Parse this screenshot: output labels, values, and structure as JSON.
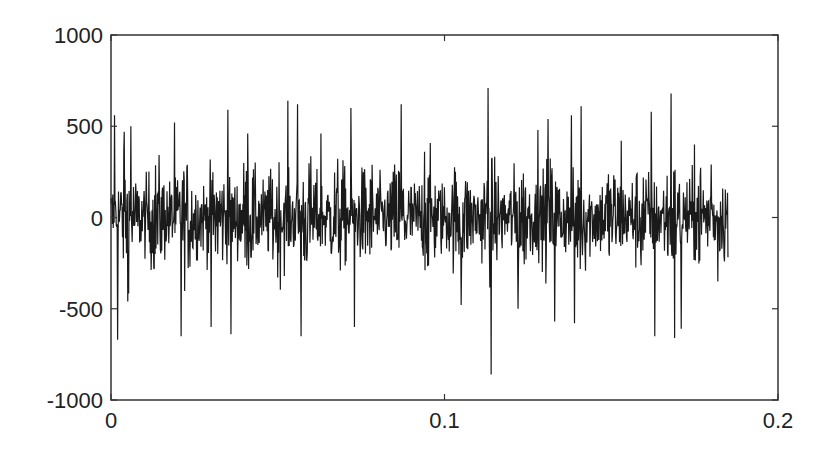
{
  "chart_data": {
    "type": "line",
    "title": "",
    "xlabel": "",
    "ylabel": "",
    "xlim": [
      0,
      0.2
    ],
    "ylim": [
      -1000,
      1000
    ],
    "xticks": [
      0,
      0.1,
      0.2
    ],
    "xtick_labels": [
      "0",
      "0.1",
      "0.2"
    ],
    "yticks": [
      -1000,
      -500,
      0,
      500,
      1000
    ],
    "ytick_labels": [
      "-1000",
      "-500",
      "0",
      "500",
      "1000"
    ],
    "grid": false,
    "legend": null,
    "series": [
      {
        "name": "signal",
        "color": "#1a1a1a",
        "description": "Dense noisy time-domain signal from t=0 to ~0.185 s, roughly zero-mean, typical amplitude ±250, peaks up to about +700 and down to about -860",
        "t_start": 0,
        "t_end": 0.185,
        "num_samples": 1400,
        "typical_amplitude": 160,
        "peak_positive": 710,
        "peak_negative": -860,
        "notable_peaks": [
          {
            "t": 0.001,
            "value": 560
          },
          {
            "t": 0.002,
            "value": -670
          },
          {
            "t": 0.004,
            "value": 470
          },
          {
            "t": 0.005,
            "value": -460
          },
          {
            "t": 0.006,
            "value": 500
          },
          {
            "t": 0.019,
            "value": 520
          },
          {
            "t": 0.021,
            "value": 590
          },
          {
            "t": 0.021,
            "value": -650
          },
          {
            "t": 0.03,
            "value": -600
          },
          {
            "t": 0.035,
            "value": 590
          },
          {
            "t": 0.036,
            "value": -640
          },
          {
            "t": 0.041,
            "value": 460
          },
          {
            "t": 0.053,
            "value": 640
          },
          {
            "t": 0.056,
            "value": 620
          },
          {
            "t": 0.057,
            "value": -650
          },
          {
            "t": 0.063,
            "value": 460
          },
          {
            "t": 0.072,
            "value": 600
          },
          {
            "t": 0.073,
            "value": -600
          },
          {
            "t": 0.087,
            "value": 620
          },
          {
            "t": 0.094,
            "value": 360
          },
          {
            "t": 0.105,
            "value": -480
          },
          {
            "t": 0.113,
            "value": 710
          },
          {
            "t": 0.114,
            "value": -860
          },
          {
            "t": 0.122,
            "value": -500
          },
          {
            "t": 0.128,
            "value": 480
          },
          {
            "t": 0.131,
            "value": 540
          },
          {
            "t": 0.133,
            "value": -570
          },
          {
            "t": 0.138,
            "value": 560
          },
          {
            "t": 0.139,
            "value": -580
          },
          {
            "t": 0.141,
            "value": 610
          },
          {
            "t": 0.153,
            "value": 420
          },
          {
            "t": 0.162,
            "value": 580
          },
          {
            "t": 0.163,
            "value": -650
          },
          {
            "t": 0.168,
            "value": 680
          },
          {
            "t": 0.169,
            "value": -660
          },
          {
            "t": 0.171,
            "value": -610
          },
          {
            "t": 0.175,
            "value": 400
          },
          {
            "t": 0.18,
            "value": 290
          },
          {
            "t": 0.182,
            "value": -350
          }
        ]
      }
    ]
  },
  "axes": {
    "frame_color": "#333333",
    "label_color": "#222222"
  }
}
